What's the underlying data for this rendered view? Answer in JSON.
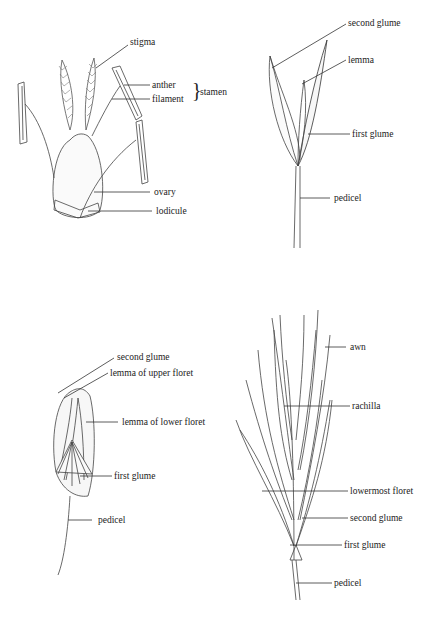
{
  "figures": [
    {
      "id": "floret-parts",
      "labels": {
        "stigma": "stigma",
        "anther": "anther",
        "filament": "filament",
        "stamen": "stamen",
        "ovary": "ovary",
        "lodicule": "lodicule"
      }
    },
    {
      "id": "single-floret-spikelet",
      "labels": {
        "second_glume": "second glume",
        "lemma": "lemma",
        "first_glume": "first glume",
        "pedicel": "pedicel"
      }
    },
    {
      "id": "two-floret-spikelet",
      "labels": {
        "second_glume": "second glume",
        "lemma_upper": "lemma of upper floret",
        "lemma_lower": "lemma of lower floret",
        "first_glume": "first glume",
        "pedicel": "pedicel"
      }
    },
    {
      "id": "multi-floret-spikelet",
      "labels": {
        "awn": "awn",
        "rachilla": "rachilla",
        "lowermost_floret": "lowermost floret",
        "second_glume": "second glume",
        "first_glume": "first glume",
        "pedicel": "pedicel"
      }
    }
  ],
  "colors": {
    "ink": "#333333",
    "paper": "#ffffff"
  }
}
